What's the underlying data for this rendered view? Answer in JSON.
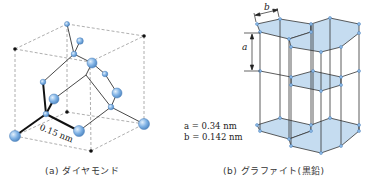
{
  "panels": {
    "diamond": {
      "caption": "(a) ダイヤモンド",
      "bond_length_label": "0.15 nm"
    },
    "graphite": {
      "caption": "(b) グラファイト(黒鉛)",
      "dimension_a_label": "a",
      "dimension_b_label": "b",
      "param_a": "a = 0.34 nm",
      "param_b": "b = 0.142 nm"
    }
  },
  "colors": {
    "atom_fill": "#7fb2e5",
    "atom_stroke": "#4a7fb8",
    "layer_fill": "#c5dcf0",
    "bond": "#333333",
    "dashed_edge": "#999999"
  }
}
